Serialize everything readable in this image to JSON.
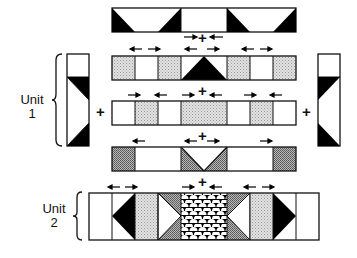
{
  "labels": {
    "unit1_line1": "Unit",
    "unit1_line2": "1",
    "unit2_line1": "Unit",
    "unit2_line2": "2",
    "plus": "+"
  },
  "colors": {
    "outline": "#111111",
    "solid": "#000000",
    "light_shade": "#d6d6d6",
    "dark_shade": "#9a9a9a",
    "background": "#ffffff"
  },
  "rows": [
    {
      "name": "top-border-strip",
      "cells": 8
    },
    {
      "name": "unit1-row-a",
      "cells": 8,
      "arrows": [
        "<- ->",
        "-> + <- / <- ->",
        "<- ->"
      ]
    },
    {
      "name": "unit1-row-b",
      "cells": 8,
      "arrows": [
        "-> <-",
        "-> + <-",
        "-> <-"
      ]
    },
    {
      "name": "unit1-row-c",
      "cells": 8,
      "arrows": [
        "<-",
        "<- + ->",
        "->"
      ]
    },
    {
      "name": "unit2-row",
      "cells": 10,
      "arrows": [
        "<- ->",
        "-> + <-",
        "<- ->"
      ]
    }
  ],
  "side_strips": [
    "left-unit1-strip",
    "right-unit1-strip"
  ]
}
